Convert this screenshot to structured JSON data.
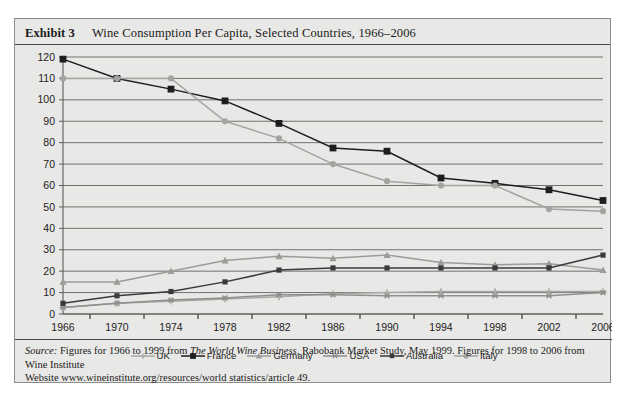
{
  "exhibit": {
    "label": "Exhibit 3",
    "title": "Wine Consumption Per Capita, Selected Countries, 1966–2006"
  },
  "source": {
    "prefix": "Source:",
    "text_1": " Figures for 1966 to 1999 from ",
    "italic_work": "The World Wine Business",
    "text_2": ", Rabobank Market Study, May 1999. Figures for 1998 to 2006 from Wine Institute",
    "line_2": "Website www.wineinstitute.org/resources/world statistics/article 49."
  },
  "chart_data": {
    "type": "line",
    "title": "Wine Consumption Per Capita, Selected Countries, 1966–2006",
    "xlabel": "",
    "ylabel": "",
    "categories": [
      1966,
      1970,
      1974,
      1978,
      1982,
      1986,
      1990,
      1994,
      1998,
      2002,
      2006
    ],
    "x": [
      "1966",
      "1970",
      "1974",
      "1978",
      "1982",
      "1986",
      "1990",
      "1994",
      "1998",
      "2002",
      "2006"
    ],
    "ylim": [
      0,
      120
    ],
    "yticks": [
      0,
      10,
      20,
      30,
      40,
      50,
      60,
      70,
      80,
      90,
      100,
      110,
      120
    ],
    "grid": true,
    "legend_position": "bottom",
    "series": [
      {
        "name": "UK",
        "color": "#a9a9a7",
        "marker": "plus",
        "values": [
          3,
          5,
          6,
          7,
          8,
          9.5,
          10,
          10.5,
          10.5,
          10.5,
          10.5
        ]
      },
      {
        "name": "France",
        "color": "#1d1d1d",
        "marker": "square",
        "values": [
          119,
          110,
          105,
          99.5,
          89,
          77.5,
          76,
          63.5,
          61,
          58,
          53
        ]
      },
      {
        "name": "Germany",
        "color": "#9b9b99",
        "marker": "triangle",
        "values": [
          15,
          15,
          20,
          25,
          27,
          26,
          27.5,
          24,
          23,
          23.5,
          20.5
        ]
      },
      {
        "name": "USA",
        "color": "#8f8f8d",
        "marker": "star",
        "values": [
          3,
          5,
          6.5,
          7.5,
          9,
          9,
          8.5,
          8.5,
          8.5,
          8.5,
          10
        ]
      },
      {
        "name": "Australia",
        "color": "#3a3a3a",
        "marker": "square-small",
        "values": [
          5,
          8.5,
          10.5,
          15,
          20.5,
          21.5,
          21.5,
          21.5,
          21.5,
          21.5,
          27.5
        ]
      },
      {
        "name": "Italy",
        "color": "#a3a3a1",
        "marker": "circle",
        "values": [
          110,
          110,
          110,
          90,
          82,
          70,
          62,
          60,
          60,
          49,
          48
        ]
      }
    ]
  }
}
